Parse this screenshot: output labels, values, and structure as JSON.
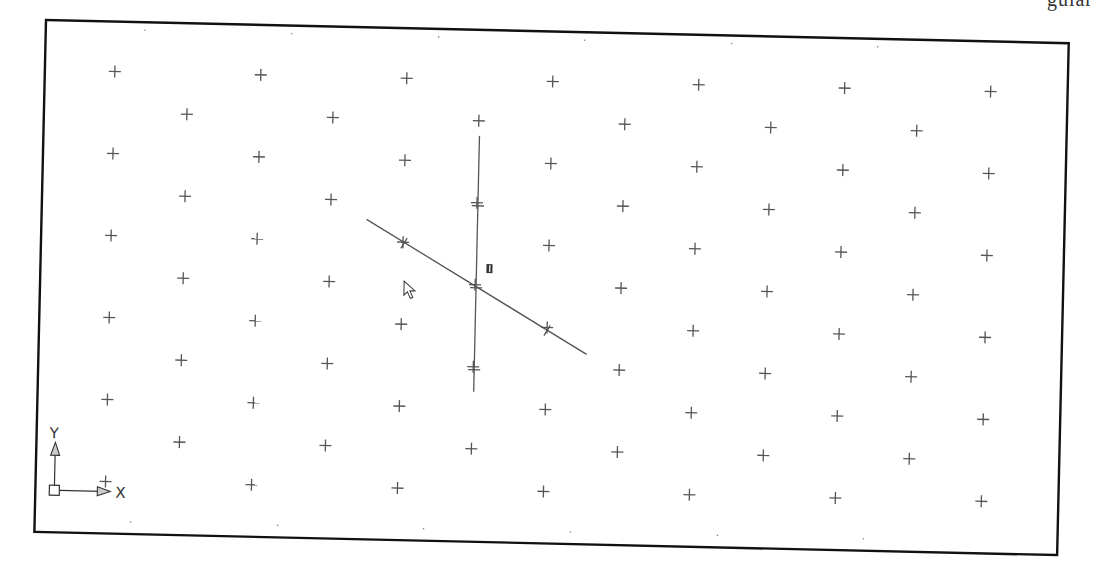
{
  "window": {
    "type": "CAD drawing area (model space) with isometric snap grid",
    "corner_text_fragment": "gular",
    "frame_color": "#111111",
    "grid_mark_color": "#555555"
  },
  "drawing": {
    "rotation_deg": 1.3,
    "frame": {
      "x": 0,
      "y": 0,
      "width": 1023,
      "height": 512
    },
    "grid": {
      "marker": "+",
      "marker_size": 12,
      "column_spacing": 73,
      "row_spacing": 41,
      "first_x": 70,
      "first_y": 50,
      "columns": 13,
      "rows": 11,
      "pattern": "isometric (alternate rows offset by half column)"
    },
    "grid_dots_top_x": [
      145,
      292,
      439,
      585,
      732,
      878
    ],
    "grid_dots_bottom_x": [
      142,
      289,
      435,
      582,
      729,
      875
    ]
  },
  "crosshair_cursor": {
    "type": "isometric crosshair",
    "center": [
      438,
      252
    ],
    "vertical_line": {
      "from": [
        440,
        123
      ],
      "to": [
        436,
        381
      ]
    },
    "iso_line": {
      "from": [
        327,
        189
      ],
      "to": [
        550,
        317
      ]
    },
    "tick_offsets": [
      -82,
      82
    ]
  },
  "pickbox_label": "iso",
  "mouse_pointer": {
    "icon": "arrow-pointer-icon",
    "x": 405,
    "y": 278
  },
  "ucs_icon": {
    "x_label": "X",
    "y_label": "Y",
    "icon": "ucs-icon"
  }
}
